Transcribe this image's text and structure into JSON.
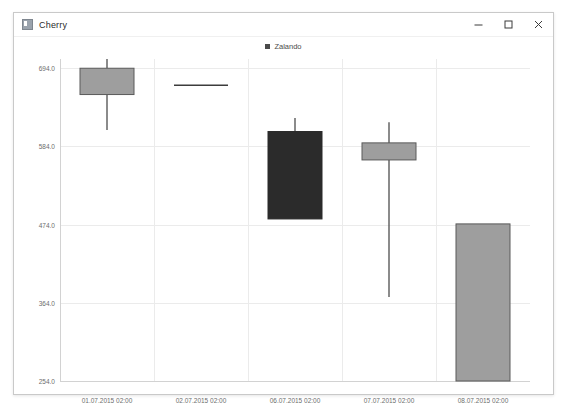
{
  "window": {
    "title": "Cherry",
    "icon": "app-icon",
    "controls": [
      {
        "name": "minimize-button",
        "glyph": "minimize"
      },
      {
        "name": "maximize-button",
        "glyph": "maximize"
      },
      {
        "name": "close-button",
        "glyph": "close"
      }
    ]
  },
  "chart_data": {
    "type": "bar",
    "subtype": "candlestick",
    "title": "",
    "xlabel": "",
    "ylabel": "",
    "legend": [
      {
        "label": "Zalando",
        "color": "#4a4a4a"
      }
    ],
    "legend_position": "top-center",
    "grid": true,
    "ylim": [
      254.0,
      707.0
    ],
    "yticks": [
      694.0,
      584.0,
      474.0,
      364.0,
      254.0
    ],
    "ytick_labels": [
      "694.0",
      "584.0",
      "474.0",
      "364.0",
      "254.0"
    ],
    "categories": [
      "01.07.2015 02:00",
      "02.07.2015 02:00",
      "06.07.2015 02:00",
      "07.07.2015 02:00",
      "08.07.2015 02:00"
    ],
    "series": [
      {
        "name": "Zalando",
        "candles": [
          {
            "x": "01.07.2015 02:00",
            "open": 657.0,
            "high": 707.0,
            "low": 607.0,
            "close": 694.0,
            "fill": "#9e9e9e",
            "stroke": "#5a5a5a",
            "direction": "up"
          },
          {
            "x": "02.07.2015 02:00",
            "open": 670.0,
            "high": 670.0,
            "low": 670.0,
            "close": 670.0,
            "fill": "#9e9e9e",
            "stroke": "#3c3c3c",
            "direction": "flat"
          },
          {
            "x": "06.07.2015 02:00",
            "open": 605.0,
            "high": 624.0,
            "low": 482.0,
            "close": 482.0,
            "fill": "#2b2b2b",
            "stroke": "#2b2b2b",
            "direction": "down"
          },
          {
            "x": "07.07.2015 02:00",
            "open": 589.0,
            "high": 618.0,
            "low": 372.0,
            "close": 565.0,
            "fill": "#9e9e9e",
            "stroke": "#5a5a5a",
            "direction": "down"
          },
          {
            "x": "08.07.2015 02:00",
            "open": 475.0,
            "high": 475.0,
            "low": 254.0,
            "close": 254.0,
            "fill": "#9e9e9e",
            "stroke": "#5a5a5a",
            "direction": "down"
          }
        ]
      }
    ],
    "colors": {
      "grid": "#ebebeb",
      "axis": "#d2d2d2",
      "tick_text": "#6d6d6d",
      "candle_up_fill": "#9e9e9e",
      "candle_down_fill": "#2b2b2b",
      "candle_stroke": "#5a5a5a",
      "background": "#ffffff"
    }
  }
}
